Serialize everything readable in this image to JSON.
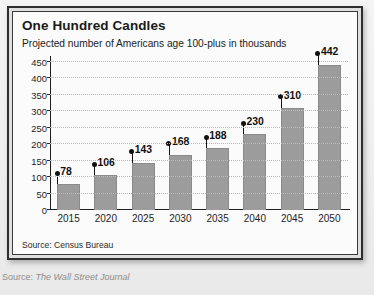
{
  "figure": {
    "title": "One Hundred Candles",
    "subtitle": "Projected number of Americans age 100-plus in thousands",
    "source_note": "Source: Census Bureau"
  },
  "caption": {
    "prefix": "Source: ",
    "publication": "The Wall Street Journal"
  },
  "chart_data": {
    "type": "bar",
    "title": "One Hundred Candles",
    "subtitle": "Projected number of Americans age 100-plus in thousands",
    "categories": [
      "2015",
      "2020",
      "2025",
      "2030",
      "2035",
      "2040",
      "2045",
      "2050"
    ],
    "values": [
      78,
      106,
      143,
      168,
      188,
      230,
      310,
      442
    ],
    "value_labels": [
      "78",
      "106",
      "143",
      "168",
      "188",
      "230",
      "310",
      "442"
    ],
    "xlabel": "",
    "ylabel": "",
    "ylim": [
      0,
      450
    ],
    "yticks": [
      0,
      50,
      100,
      150,
      200,
      250,
      300,
      350,
      400,
      450
    ],
    "ytick_labels": [
      "0",
      "50",
      "100",
      "150",
      "200",
      "250",
      "300",
      "350",
      "400",
      "450"
    ],
    "grid": true,
    "legend": false,
    "series_color": "#9c9c9c",
    "marker_color": "#111111",
    "source": "Source: Census Bureau"
  }
}
